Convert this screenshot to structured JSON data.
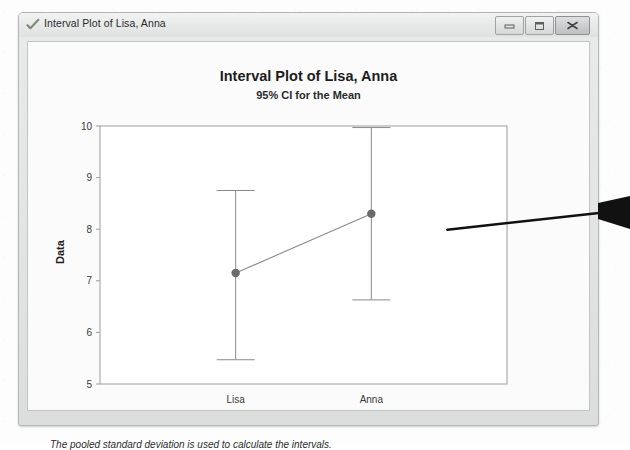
{
  "window": {
    "title": "Interval Plot of Lisa, Anna",
    "icon": "minitab-checkmark-icon",
    "controls": {
      "minimize": "Minimize",
      "maximize": "Maximize",
      "close": "Close"
    }
  },
  "chart_data": {
    "type": "line",
    "title": "Interval Plot of Lisa, Anna",
    "subtitle": "95% CI for the Mean",
    "xlabel": "",
    "ylabel": "Data",
    "categories": [
      "Lisa",
      "Anna"
    ],
    "values": [
      7.15,
      8.3
    ],
    "error_low": [
      5.47,
      6.63
    ],
    "error_high": [
      8.75,
      9.97
    ],
    "series": [
      {
        "name": "Mean",
        "values": [
          7.15,
          8.3
        ]
      }
    ],
    "points": [
      {
        "category": "Lisa",
        "mean": 7.15,
        "ci_lower": 5.47,
        "ci_upper": 8.75
      },
      {
        "category": "Anna",
        "mean": 8.3,
        "ci_lower": 6.63,
        "ci_upper": 9.97
      }
    ],
    "ylim": [
      5,
      10
    ],
    "yticks": [
      "10",
      "9",
      "8",
      "7",
      "6",
      "5"
    ],
    "ytick_values": [
      10,
      9,
      8,
      7,
      6,
      5
    ],
    "grid": false,
    "legend": "none",
    "footnote": "The pooled standard deviation is used to calculate the intervals.",
    "marker_color": "#6b6b6b",
    "line_color": "#8a8a8a",
    "axis_color": "#9b9d9e",
    "plot_background": "#ffffff"
  },
  "annotation": {
    "arrow": "pointer-arrow",
    "arrow_color": "#111111"
  }
}
